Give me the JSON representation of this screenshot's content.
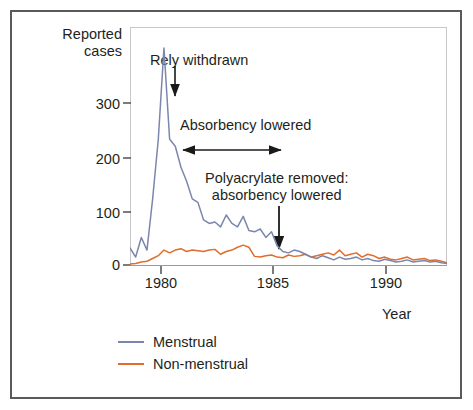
{
  "figure": {
    "background": "#ffffff",
    "frame_color": "#5a5a5a",
    "plot_border_color": "#c8c8cc"
  },
  "labels": {
    "ylabel_line1": "Reported",
    "ylabel_line2": "cases",
    "xlabel": "Year"
  },
  "annotations": {
    "rely": "Rely withdrawn",
    "absorbency": "Absorbency lowered",
    "polyacrylate_line1": "Polyacrylate removed:",
    "polyacrylate_line2": "absorbency lowered"
  },
  "legend": {
    "items": [
      {
        "label": "Menstrual",
        "color": "#7b86ad"
      },
      {
        "label": "Non-menstrual",
        "color": "#e06c2d"
      }
    ]
  },
  "chart_data": {
    "type": "line",
    "title": "",
    "xlabel": "Year",
    "ylabel": "Reported cases",
    "xlim": [
      1979.0,
      1993.0
    ],
    "ylim": [
      0,
      340
    ],
    "yticks": [
      0,
      100,
      200,
      300
    ],
    "xticks": [
      1980,
      1985,
      1990
    ],
    "grid": false,
    "legend_position": "below-axes-left",
    "annotations": [
      {
        "text": "Rely withdrawn",
        "type": "arrow-down",
        "x": 1980.85,
        "y": 310
      },
      {
        "text": "Absorbency lowered",
        "type": "arrow-double",
        "x_start": 1981.5,
        "x_end": 1986.2
      },
      {
        "text": "Polyacrylate removed: absorbency lowered",
        "type": "arrow-down",
        "x": 1985.7,
        "y": 30
      }
    ],
    "x": [
      1979.0,
      1979.25,
      1979.5,
      1979.75,
      1980.0,
      1980.25,
      1980.5,
      1980.75,
      1981.0,
      1981.25,
      1981.5,
      1981.75,
      1982.0,
      1982.25,
      1982.5,
      1982.75,
      1983.0,
      1983.25,
      1983.5,
      1983.75,
      1984.0,
      1984.25,
      1984.5,
      1984.75,
      1985.0,
      1985.25,
      1985.5,
      1985.75,
      1986.0,
      1986.25,
      1986.5,
      1986.75,
      1987.0,
      1987.25,
      1987.5,
      1987.75,
      1988.0,
      1988.25,
      1988.5,
      1988.75,
      1989.0,
      1989.25,
      1989.5,
      1989.75,
      1990.0,
      1990.25,
      1990.5,
      1990.75,
      1991.0,
      1991.25,
      1991.5,
      1991.75,
      1992.0,
      1992.25,
      1992.5,
      1992.75,
      1993.0
    ],
    "series": [
      {
        "name": "Menstrual",
        "color": "#7b86ad",
        "values": [
          25,
          12,
          40,
          22,
          95,
          180,
          310,
          180,
          170,
          140,
          120,
          95,
          90,
          65,
          60,
          62,
          55,
          72,
          60,
          55,
          70,
          50,
          48,
          52,
          40,
          48,
          28,
          20,
          18,
          22,
          20,
          16,
          12,
          10,
          14,
          11,
          8,
          12,
          9,
          10,
          12,
          8,
          10,
          7,
          6,
          9,
          7,
          5,
          6,
          8,
          5,
          6,
          7,
          5,
          6,
          4,
          3
        ]
      },
      {
        "name": "Non-menstrual",
        "color": "#e06c2d",
        "values": [
          2,
          3,
          5,
          6,
          10,
          14,
          22,
          18,
          22,
          24,
          20,
          22,
          21,
          20,
          22,
          23,
          16,
          20,
          22,
          26,
          29,
          26,
          13,
          12,
          14,
          15,
          12,
          11,
          15,
          13,
          14,
          16,
          12,
          14,
          16,
          18,
          15,
          22,
          14,
          16,
          18,
          12,
          16,
          14,
          10,
          12,
          9,
          8,
          10,
          12,
          8,
          9,
          10,
          7,
          8,
          6,
          4
        ]
      }
    ]
  }
}
